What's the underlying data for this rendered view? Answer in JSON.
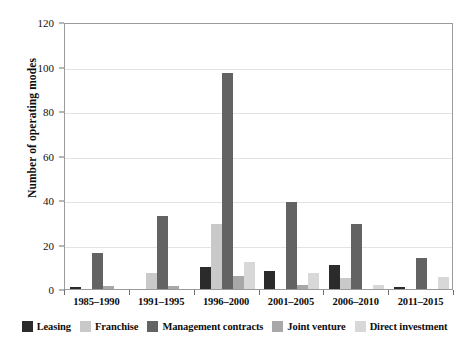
{
  "chart_data": {
    "type": "bar",
    "title": "",
    "xlabel": "",
    "ylabel": "Number of operating modes",
    "ylim": [
      0,
      120
    ],
    "yticks": [
      0,
      20,
      40,
      60,
      80,
      100,
      120
    ],
    "grid": true,
    "legend_position": "bottom",
    "categories": [
      "1985–1990",
      "1991–1995",
      "1996–2000",
      "2001–2005",
      "2006–2010",
      "2011–2015"
    ],
    "series": [
      {
        "name": "Leasing",
        "color": "#2b2b2b",
        "values": [
          1,
          0,
          10,
          8,
          11,
          1
        ]
      },
      {
        "name": "Franchise",
        "color": "#c9c9c9",
        "values": [
          0,
          7,
          29,
          0,
          5,
          0
        ]
      },
      {
        "name": "Management contracts",
        "color": "#636363",
        "values": [
          16,
          33,
          97,
          39,
          29,
          14
        ]
      },
      {
        "name": "Joint venture",
        "color": "#a8a8a8",
        "values": [
          1.5,
          1.5,
          6,
          2,
          0,
          0
        ]
      },
      {
        "name": "Direct investment",
        "color": "#d8d8d8",
        "values": [
          0,
          0,
          12,
          7,
          2,
          5.5
        ]
      }
    ]
  },
  "axis": {
    "y_label": "Number of operating modes",
    "y_tick_labels": [
      "0",
      "20",
      "40",
      "60",
      "80",
      "100",
      "120"
    ],
    "x_tick_labels": [
      "1985–1990",
      "1991–1995",
      "1996–2000",
      "2001–2005",
      "2006–2010",
      "2011–2015"
    ]
  },
  "legend": {
    "items": [
      {
        "label": "Leasing",
        "color": "#2b2b2b"
      },
      {
        "label": "Franchise",
        "color": "#c9c9c9"
      },
      {
        "label": "Management contracts",
        "color": "#636363"
      },
      {
        "label": "Joint venture",
        "color": "#a8a8a8"
      },
      {
        "label": "Direct investment",
        "color": "#d8d8d8"
      }
    ]
  },
  "colors": {
    "plot_border": "#9a9a9a",
    "gridline": "#e3e3e3",
    "text": "#0d0d0d",
    "background": "#ffffff"
  }
}
